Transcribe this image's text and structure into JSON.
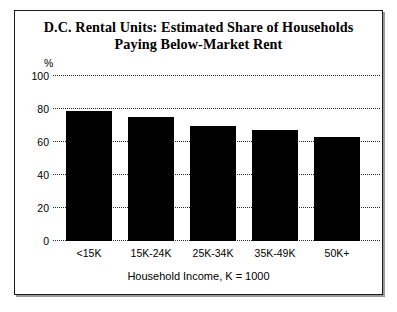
{
  "chart_data": {
    "type": "bar",
    "title": "D.C. Rental Units: Estimated Share of Households Paying Below-Market Rent",
    "title_line1": "D.C. Rental Units: Estimated Share of Households",
    "title_line2": "Paying Below-Market Rent",
    "categories": [
      "<15K",
      "15K-24K",
      "25K-34K",
      "35K-49K",
      "50K+"
    ],
    "values": [
      79,
      75,
      70,
      67,
      63
    ],
    "xlabel": "Household Income, K = 1000",
    "ylabel": "%",
    "ylim": [
      0,
      100
    ],
    "yticks": [
      0,
      20,
      40,
      60,
      80,
      100
    ],
    "ytick_labels": [
      "0",
      "20",
      "40",
      "60",
      "80",
      "100"
    ],
    "grid": true,
    "grid_style": "dotted",
    "legend": null,
    "bar_color": "#000000",
    "background_color": "#ffffff",
    "frame_color": "#1c1c1c"
  }
}
